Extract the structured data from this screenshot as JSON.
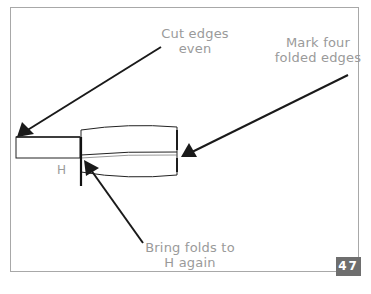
{
  "diagram": {
    "labels": {
      "cut_edges": "Cut edges\neven",
      "mark_four": "Mark four\nfolded edges",
      "bring_folds": "Bring folds to\nH again",
      "h_marker": "H"
    },
    "page_number": "47",
    "colors": {
      "frame_border": "#a8a8a8",
      "label_text": "#9a9a9a",
      "arrow": "#1a1a1a",
      "badge_bg": "#6e6e6e",
      "badge_text": "#ffffff"
    }
  }
}
